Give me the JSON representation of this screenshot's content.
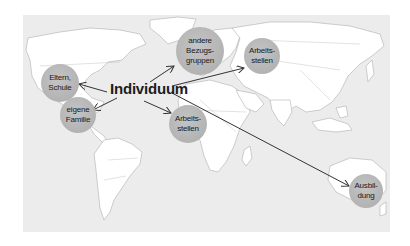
{
  "diagram": {
    "title": "Individuum",
    "background": "world-map",
    "colors": {
      "ocean": "#ececec",
      "land": "#ffffff",
      "border": "#9a9a9a",
      "node_fill": "#b5b5b5",
      "text": "#1a1a1a",
      "arrow": "#333333"
    },
    "center": {
      "label": "Individuum",
      "x": 155,
      "y": 90
    },
    "nodes": [
      {
        "id": "eltern-schule",
        "lines": [
          "Eltern,",
          "Schule"
        ],
        "x": 60,
        "y": 83,
        "r": 19
      },
      {
        "id": "eigene-familie",
        "lines": [
          "eigene",
          "Familie"
        ],
        "x": 78,
        "y": 115,
        "r": 18
      },
      {
        "id": "andere-bezugsgruppen",
        "lines": [
          "andere",
          "Bezugs-",
          "gruppen"
        ],
        "x": 200,
        "y": 51,
        "r": 24
      },
      {
        "id": "arbeitsstellen-eurasien",
        "lines": [
          "Arbeits-",
          "stellen"
        ],
        "x": 262,
        "y": 56,
        "r": 18
      },
      {
        "id": "arbeitsstellen-afrika",
        "lines": [
          "Arbeits-",
          "stellen"
        ],
        "x": 188,
        "y": 124,
        "r": 19
      },
      {
        "id": "ausbildung",
        "lines": [
          "Ausbil-",
          "dung"
        ],
        "x": 366,
        "y": 191,
        "r": 17
      }
    ],
    "edges": [
      {
        "from": "center",
        "to": "eltern-schule",
        "x1": 107,
        "y1": 92,
        "x2": 79,
        "y2": 84
      },
      {
        "from": "center",
        "to": "eigene-familie",
        "x1": 117,
        "y1": 98,
        "x2": 93,
        "y2": 110
      },
      {
        "from": "center",
        "to": "andere-bezugsgruppen",
        "x1": 150,
        "y1": 82,
        "x2": 174,
        "y2": 66
      },
      {
        "from": "center",
        "to": "arbeitsstellen-eurasien",
        "x1": 172,
        "y1": 86,
        "x2": 244,
        "y2": 68
      },
      {
        "from": "center",
        "to": "arbeitsstellen-afrika",
        "x1": 144,
        "y1": 101,
        "x2": 171,
        "y2": 113
      },
      {
        "from": "center",
        "to": "ausbildung",
        "x1": 172,
        "y1": 93,
        "x2": 349,
        "y2": 186
      }
    ]
  }
}
